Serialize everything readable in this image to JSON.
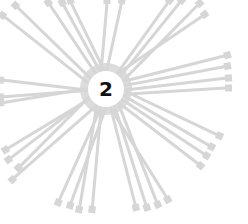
{
  "illustration": {
    "subject": "cable ties radiating from a central numbered circle",
    "center_label": "2",
    "center": [
      106,
      89
    ],
    "tie_color": "#d6d6d6",
    "label_color": "#111111",
    "background": "#ffffff",
    "tie_ends": [
      [
        2,
        15
      ],
      [
        15,
        5
      ],
      [
        48,
        2
      ],
      [
        62,
        2
      ],
      [
        70,
        0
      ],
      [
        107,
        0
      ],
      [
        122,
        0
      ],
      [
        170,
        0
      ],
      [
        182,
        0
      ],
      [
        200,
        3
      ],
      [
        205,
        14
      ],
      [
        228,
        55
      ],
      [
        228,
        66
      ],
      [
        229,
        78
      ],
      [
        229,
        88
      ],
      [
        220,
        136
      ],
      [
        212,
        147
      ],
      [
        207,
        156
      ],
      [
        201,
        166
      ],
      [
        168,
        200
      ],
      [
        158,
        205
      ],
      [
        147,
        208
      ],
      [
        136,
        208
      ],
      [
        92,
        210
      ],
      [
        79,
        210
      ],
      [
        70,
        206
      ],
      [
        58,
        203
      ],
      [
        5,
        150
      ],
      [
        8,
        160
      ],
      [
        18,
        168
      ],
      [
        12,
        180
      ],
      [
        0,
        80
      ],
      [
        0,
        97
      ],
      [
        0,
        103
      ]
    ]
  }
}
